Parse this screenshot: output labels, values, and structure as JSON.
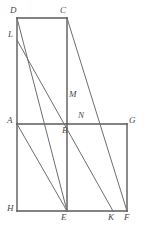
{
  "figure": {
    "canvas": {
      "width": 144,
      "height": 237
    },
    "style": {
      "background_color": "#ffffff",
      "stroke_color": "#5a5a5a",
      "diagonal_stroke_color": "#6e6e6e",
      "label_color": "#4a4a4a",
      "edge_stroke_width": 1.4,
      "diagonal_stroke_width": 1.0,
      "label_font_size": 9
    },
    "points": [
      {
        "name": "D",
        "label": "D",
        "x": 17,
        "y": 18,
        "label_x": 10,
        "label_y": 6
      },
      {
        "name": "C",
        "label": "C",
        "x": 67,
        "y": 18,
        "label_x": 60,
        "label_y": 6
      },
      {
        "name": "L",
        "label": "L",
        "x": 17,
        "y": 40,
        "label_x": 8,
        "label_y": 30
      },
      {
        "name": "M",
        "label": "M",
        "x": 67,
        "y": 97,
        "label_x": 69,
        "label_y": 90
      },
      {
        "name": "A",
        "label": "A",
        "x": 17,
        "y": 124,
        "label_x": 7,
        "label_y": 116
      },
      {
        "name": "B",
        "label": "B",
        "x": 67,
        "y": 124,
        "label_x": 62,
        "label_y": 126
      },
      {
        "name": "N",
        "label": "N",
        "x": 80,
        "y": 124,
        "label_x": 78,
        "label_y": 111
      },
      {
        "name": "G",
        "label": "G",
        "x": 127,
        "y": 124,
        "label_x": 129,
        "label_y": 116
      },
      {
        "name": "H",
        "label": "H",
        "x": 17,
        "y": 211,
        "label_x": 7,
        "label_y": 204
      },
      {
        "name": "E",
        "label": "E",
        "x": 67,
        "y": 211,
        "label_x": 61,
        "label_y": 213
      },
      {
        "name": "K",
        "label": "K",
        "x": 113,
        "y": 211,
        "label_x": 108,
        "label_y": 213
      },
      {
        "name": "F",
        "label": "F",
        "x": 127,
        "y": 211,
        "label_x": 124,
        "label_y": 213
      }
    ],
    "segments": [
      {
        "name": "edge-DC",
        "kind": "edge",
        "x1": 17,
        "y1": 18,
        "x2": 67,
        "y2": 18
      },
      {
        "name": "edge-DA",
        "kind": "edge",
        "x1": 17,
        "y1": 18,
        "x2": 17,
        "y2": 124
      },
      {
        "name": "edge-CB",
        "kind": "edge",
        "x1": 67,
        "y1": 18,
        "x2": 67,
        "y2": 124
      },
      {
        "name": "edge-AG",
        "kind": "edge",
        "x1": 17,
        "y1": 124,
        "x2": 127,
        "y2": 124
      },
      {
        "name": "edge-AH",
        "kind": "edge",
        "x1": 17,
        "y1": 124,
        "x2": 17,
        "y2": 211
      },
      {
        "name": "edge-BE",
        "kind": "edge",
        "x1": 67,
        "y1": 124,
        "x2": 67,
        "y2": 211
      },
      {
        "name": "edge-GF",
        "kind": "edge",
        "x1": 127,
        "y1": 124,
        "x2": 127,
        "y2": 211
      },
      {
        "name": "edge-HF",
        "kind": "edge",
        "x1": 17,
        "y1": 211,
        "x2": 127,
        "y2": 211
      },
      {
        "name": "diag-DE",
        "kind": "diagonal",
        "x1": 17,
        "y1": 18,
        "x2": 67,
        "y2": 211
      },
      {
        "name": "diag-LK",
        "kind": "diagonal",
        "x1": 17,
        "y1": 40,
        "x2": 113,
        "y2": 211
      },
      {
        "name": "diag-CF",
        "kind": "diagonal",
        "x1": 67,
        "y1": 18,
        "x2": 127,
        "y2": 211
      },
      {
        "name": "diag-AE",
        "kind": "diagonal",
        "x1": 17,
        "y1": 124,
        "x2": 67,
        "y2": 211
      }
    ]
  }
}
